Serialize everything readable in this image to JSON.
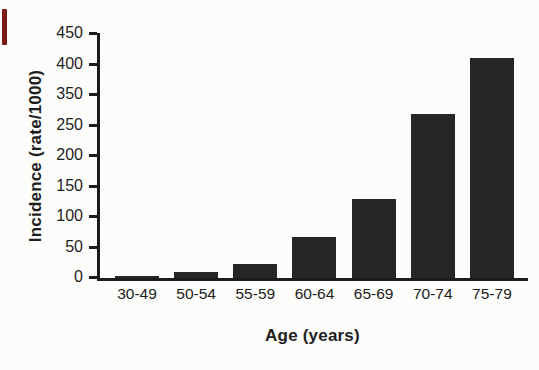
{
  "figure": {
    "kind": "scanned textbook bar chart"
  },
  "artifacts": {
    "red_scan_mark_color": "#7c1a1a"
  },
  "chart_data": {
    "type": "bar",
    "title": "",
    "xlabel": "Age (years)",
    "ylabel": "Incidence (rate/1000)",
    "categories": [
      "30-49",
      "50-54",
      "55-59",
      "60-64",
      "65-69",
      "70-74",
      "75-79"
    ],
    "values": [
      4,
      12,
      25,
      70,
      130,
      275,
      405
    ],
    "bar_heights_pct": [
      0.9,
      2.6,
      5.6,
      16.9,
      32.3,
      67.0,
      89.6
    ],
    "y_tick_labels_top_to_bottom": [
      "450",
      "400",
      "350",
      "250",
      "200",
      "150",
      "100",
      "50",
      "0"
    ],
    "ylim": [
      0,
      450
    ],
    "bar_color": "#262626",
    "axis_color": "#1c1c1c",
    "grid": "off",
    "legend": "none"
  }
}
